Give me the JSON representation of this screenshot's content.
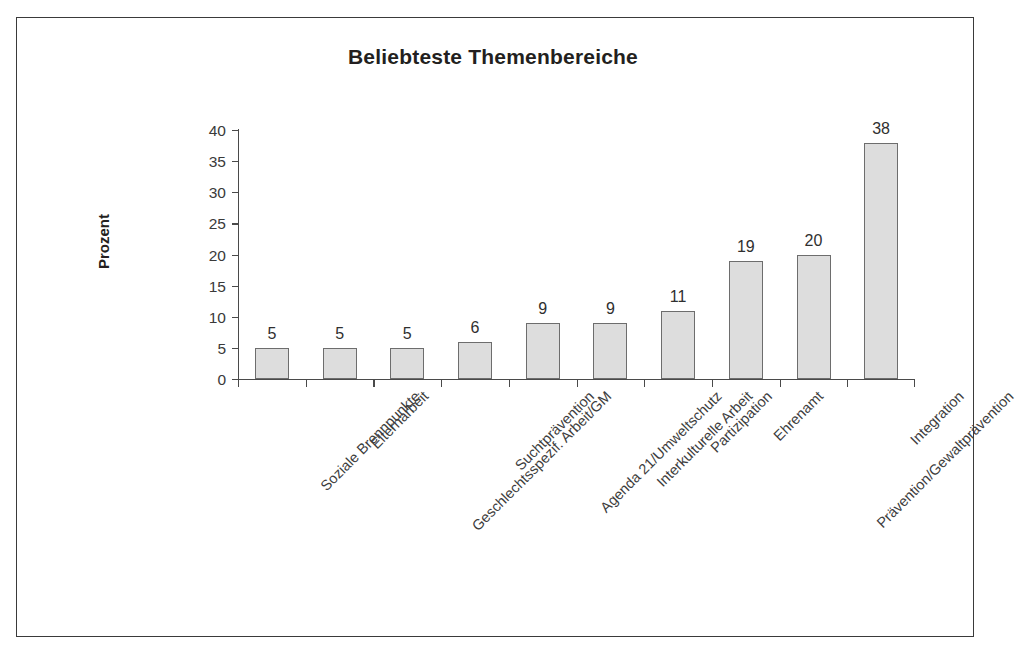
{
  "chart_data": {
    "type": "bar",
    "title": "Beliebteste Themenbereiche",
    "xlabel": "",
    "ylabel": "Prozent",
    "ylim": [
      0,
      40
    ],
    "ytick_step": 5,
    "yticks": [
      0,
      5,
      10,
      15,
      20,
      25,
      30,
      35,
      40
    ],
    "ytick_labels": [
      "0",
      "5",
      "10",
      "15",
      "20",
      "25",
      "30",
      "35",
      "40"
    ],
    "grid": false,
    "legend": false,
    "bar_fill_color": "#dddddd",
    "bar_border_color": "#6d6d6d",
    "categories": [
      "Soziale Brennpunkte",
      "Elternarbeit",
      "Geschlechtsspezif. Arbeit/GM",
      "Suchtprävention",
      "Agenda 21/Umweltschutz",
      "Interkulturelle Arbeit",
      "Partizipation",
      "Ehrenamt",
      "Prävention/Gewaltprävention",
      "Integration"
    ],
    "values": [
      5,
      5,
      5,
      6,
      9,
      9,
      11,
      19,
      20,
      38
    ],
    "value_labels": [
      "5",
      "5",
      "5",
      "6",
      "9",
      "9",
      "11",
      "19",
      "20",
      "38"
    ]
  }
}
